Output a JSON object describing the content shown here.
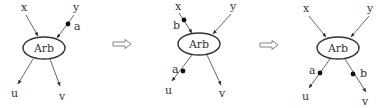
{
  "diagrams": [
    {
      "node_label": "Arb",
      "inputs": [
        "x",
        "y"
      ],
      "outputs": [
        "u",
        "v"
      ],
      "tokens": [
        {
          "label": "a",
          "wire": "y"
        }
      ]
    },
    {
      "node_label": "Arb",
      "inputs": [
        "x",
        "y"
      ],
      "outputs": [
        "u",
        "v"
      ],
      "tokens": [
        {
          "label": "b",
          "wire": "x"
        },
        {
          "label": "a",
          "wire": "u"
        }
      ]
    },
    {
      "node_label": "Arb",
      "inputs": [
        "x",
        "y"
      ],
      "outputs": [
        "u",
        "v"
      ],
      "tokens": [
        {
          "label": "a",
          "wire": "u"
        },
        {
          "label": "b",
          "wire": "v"
        }
      ]
    }
  ],
  "transitions": [
    {
      "symbol": "⇒",
      "icon": "double-arrow-right-icon"
    },
    {
      "symbol": "⇒",
      "icon": "double-arrow-right-icon"
    }
  ]
}
